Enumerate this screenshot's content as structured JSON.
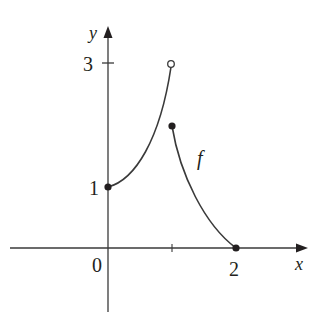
{
  "figure": {
    "type": "function-graph",
    "function_label": "f",
    "axes": {
      "x_label": "x",
      "y_label": "y",
      "x_ticks": [
        {
          "value": 0,
          "label": "0"
        },
        {
          "value": 1,
          "label": ""
        },
        {
          "value": 2,
          "label": "2"
        }
      ],
      "y_ticks": [
        {
          "value": 1,
          "label": "1"
        },
        {
          "value": 3,
          "label": "3"
        }
      ]
    },
    "pieces": [
      {
        "name": "left-branch",
        "shape": "increasing concave-up curve",
        "from": [
          0,
          1
        ],
        "to": [
          1,
          3
        ],
        "start_point": "closed",
        "end_point": "open"
      },
      {
        "name": "right-branch",
        "shape": "decreasing concave-up curve",
        "from": [
          1,
          2
        ],
        "to": [
          2,
          0
        ],
        "start_point": "closed",
        "end_point": "closed"
      }
    ],
    "points": [
      {
        "x": 0,
        "y": 1,
        "style": "closed"
      },
      {
        "x": 1,
        "y": 3,
        "style": "open"
      },
      {
        "x": 1,
        "y": 2,
        "style": "closed"
      },
      {
        "x": 2,
        "y": 0,
        "style": "closed"
      }
    ],
    "colors": {
      "axis": "#3a3a3a",
      "curve": "#3a3a3a",
      "text": "#231f20"
    }
  }
}
